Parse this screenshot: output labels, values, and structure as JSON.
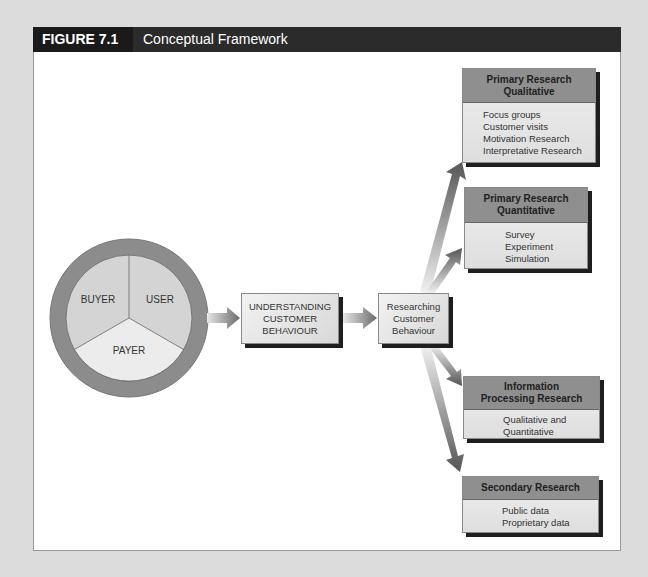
{
  "figure": {
    "number_label": "FIGURE 7.1",
    "title": "Conceptual Framework"
  },
  "circle": {
    "segments": [
      {
        "label": "BUYER"
      },
      {
        "label": "USER"
      },
      {
        "label": "PAYER"
      }
    ]
  },
  "flow": {
    "understanding": [
      "UNDERSTANDING",
      "CUSTOMER",
      "BEHAVIOUR"
    ],
    "researching": [
      "Researching",
      "Customer",
      "Behaviour"
    ]
  },
  "research_types": [
    {
      "title_lines": [
        "Primary Research",
        "Qualitative"
      ],
      "items": [
        "Focus groups",
        "Customer visits",
        "Motivation Research",
        "Interpretative Research"
      ]
    },
    {
      "title_lines": [
        "Primary Research",
        "Quantitative"
      ],
      "items": [
        "Survey",
        "Experiment",
        "Simulation"
      ]
    },
    {
      "title_lines": [
        "Information",
        "Processing Research"
      ],
      "items": [
        "Qualitative and",
        "Quantitative"
      ]
    },
    {
      "title_lines": [
        "Secondary Research"
      ],
      "items": [
        "Public data",
        "Proprietary data"
      ]
    }
  ],
  "colors": {
    "header_bg": "#2b2b2b",
    "label_bg": "#1a1a1a",
    "ring": "#8c8c8c",
    "box_header": "#8f8f8f",
    "arrow": "#6e6e6e"
  }
}
